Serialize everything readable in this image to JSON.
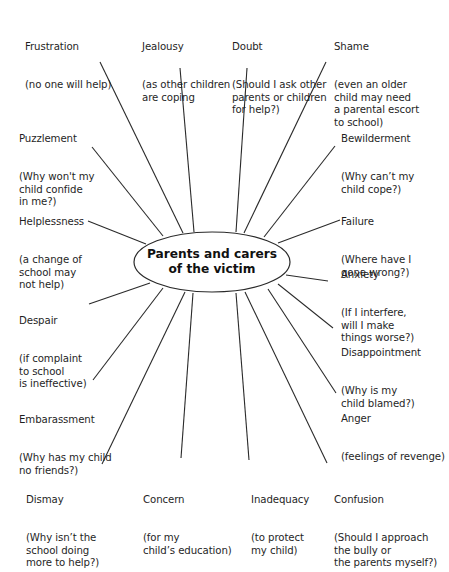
{
  "center": {
    "line1": "Parents and carers",
    "line2": "of the victim"
  },
  "nodes": [
    {
      "id": "frustration",
      "title": "Frustration",
      "detail": "(no one will help)"
    },
    {
      "id": "jealousy",
      "title": "Jealousy",
      "detail": "(as other children\nare coping"
    },
    {
      "id": "doubt",
      "title": "Doubt",
      "detail": "(Should I ask other\nparents or children\nfor help?)"
    },
    {
      "id": "shame",
      "title": "Shame",
      "detail": "(even an older\nchild may need\na parental escort\nto school)"
    },
    {
      "id": "puzzlement",
      "title": "Puzzlement",
      "detail": "(Why won't my\nchild confide\nin me?)"
    },
    {
      "id": "bewilderment",
      "title": "Bewilderment",
      "detail": "(Why can’t my\nchild cope?)"
    },
    {
      "id": "helplessness",
      "title": "Helplessness",
      "detail": "(a change of\nschool may\nnot help)"
    },
    {
      "id": "failure",
      "title": "Failure",
      "detail": "(Where have I\ngone wrong?)"
    },
    {
      "id": "anxiety",
      "title": "Anxiety",
      "detail": "(If I interfere,\nwill I make\nthings worse?)"
    },
    {
      "id": "despair",
      "title": "Despair",
      "detail": "(if complaint\nto school\nis ineffective)"
    },
    {
      "id": "disappointment",
      "title": "Disappointment",
      "detail": "(Why is my\nchild blamed?)"
    },
    {
      "id": "embarassment",
      "title": "Embarassment",
      "detail": "(Why has my child\nno friends?)"
    },
    {
      "id": "anger",
      "title": "Anger",
      "detail": "(feelings of revenge)"
    },
    {
      "id": "dismay",
      "title": "Dismay",
      "detail": "(Why isn’t the\nschool doing\nmore to help?)"
    },
    {
      "id": "concern",
      "title": "Concern",
      "detail": "(for my\nchild’s education)"
    },
    {
      "id": "inadequacy",
      "title": "Inadequacy",
      "detail": "(to protect\nmy child)"
    },
    {
      "id": "confusion",
      "title": "Confusion",
      "detail": "(Should I approach\nthe bully or\nthe parents myself?)"
    }
  ],
  "colors": {
    "line": "#2a2a2a",
    "text": "#1f1f1f",
    "background": "#ffffff"
  }
}
